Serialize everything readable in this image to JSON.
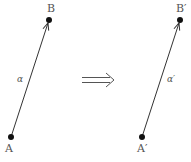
{
  "diagram": {
    "left_vector": {
      "start": {
        "label": "A",
        "x": 11,
        "y": 137
      },
      "end": {
        "label": "B",
        "x": 49,
        "y": 20
      },
      "name": "α",
      "name_pos": {
        "x": 20,
        "y": 82
      }
    },
    "implies_symbol": "⟹",
    "right_vector": {
      "start": {
        "label": "A′",
        "x": 142,
        "y": 137
      },
      "end": {
        "label": "B′",
        "x": 180,
        "y": 20
      },
      "name": "α′",
      "name_pos": {
        "x": 170,
        "y": 82
      }
    },
    "colors": {
      "line": "#333333",
      "point": "#111111",
      "label": "#555555"
    }
  }
}
